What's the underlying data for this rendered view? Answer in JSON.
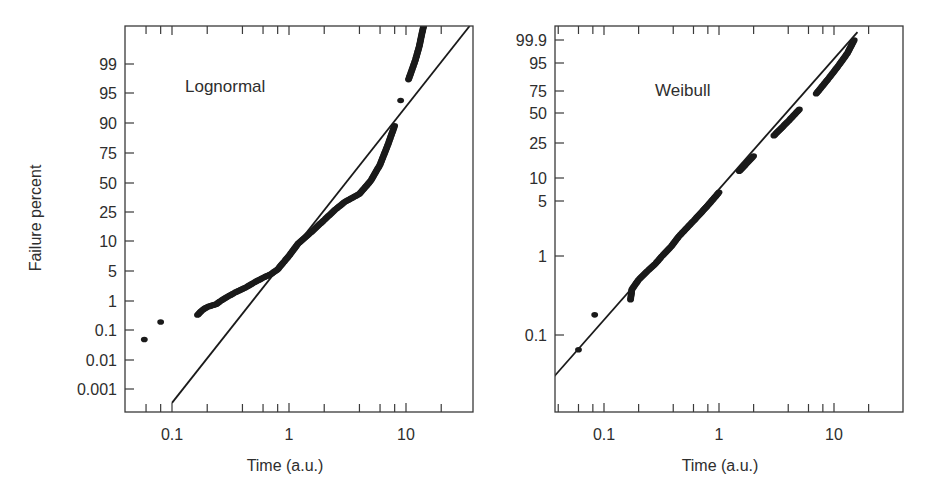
{
  "figure": {
    "ylabel": "Failure percent",
    "colors": {
      "ink": "#1a1a1a",
      "text": "#2e2e2e",
      "frame": "#3a3a3a",
      "background": "#ffffff"
    }
  },
  "chart_data": [
    {
      "type": "scatter",
      "title": "Lognormal",
      "panel_label": "Lognormal",
      "xlabel": "Time (a.u.)",
      "ylabel": "Failure percent",
      "xscale": "log",
      "yscale": "lognormal probability",
      "xlim": [
        0.04,
        40
      ],
      "x_ticks": [
        0.1,
        1,
        10
      ],
      "x_tick_labels": [
        "0.1",
        "1",
        "10"
      ],
      "y_ticks": [
        0.001,
        0.01,
        0.1,
        1,
        5,
        10,
        25,
        50,
        75,
        90,
        95,
        99
      ],
      "y_tick_labels": [
        "0.001",
        "0.01",
        "0.1",
        "1",
        "5",
        "10",
        "25",
        "50",
        "75",
        "90",
        "95",
        "99"
      ],
      "grid": false,
      "fit_line": {
        "from": [
          0.1,
          0.0003
        ],
        "to": [
          35,
          99.99
        ]
      },
      "series": [
        {
          "name": "data",
          "points": [
            [
              0.058,
              0.05
            ],
            [
              0.08,
              0.2
            ],
            [
              0.165,
              0.35
            ],
            [
              0.18,
              0.5
            ],
            [
              0.2,
              0.65
            ],
            [
              0.24,
              0.8
            ],
            [
              0.26,
              1.0
            ],
            [
              0.3,
              1.3
            ],
            [
              0.34,
              1.6
            ],
            [
              0.43,
              2.2
            ],
            [
              0.5,
              2.8
            ],
            [
              0.6,
              3.6
            ],
            [
              0.7,
              4.3
            ],
            [
              0.8,
              5.2
            ],
            [
              0.9,
              6.2
            ],
            [
              1.0,
              7.2
            ],
            [
              1.2,
              9.5
            ],
            [
              1.5,
              13
            ],
            [
              2.0,
              20
            ],
            [
              2.5,
              27
            ],
            [
              3.0,
              33
            ],
            [
              4.0,
              40
            ],
            [
              5.0,
              52
            ],
            [
              6.0,
              66
            ],
            [
              7.0,
              80
            ],
            [
              8.0,
              89
            ],
            [
              9.0,
              94
            ],
            [
              10.5,
              97.5
            ],
            [
              12.0,
              99.2
            ],
            [
              13.0,
              99.7
            ],
            [
              13.5,
              99.85
            ],
            [
              14.5,
              99.96
            ]
          ]
        }
      ]
    },
    {
      "type": "scatter",
      "title": "Weibull",
      "panel_label": "Weibull",
      "xlabel": "Time (a.u.)",
      "ylabel": "",
      "xscale": "log",
      "yscale": "weibull probability",
      "xlim": [
        0.037,
        40
      ],
      "x_ticks": [
        0.1,
        1,
        10
      ],
      "x_tick_labels": [
        "0.1",
        "1",
        "10"
      ],
      "y_ticks": [
        0.1,
        1,
        5,
        10,
        25,
        50,
        75,
        95,
        99.9
      ],
      "y_tick_labels": [
        "0.1",
        "1",
        "5",
        "10",
        "25",
        "50",
        "75",
        "95",
        "99.9"
      ],
      "grid": false,
      "fit_line": {
        "from": [
          0.037,
          0.03
        ],
        "to": [
          16,
          99.99
        ]
      },
      "series": [
        {
          "name": "data",
          "points": [
            [
              0.06,
              0.065
            ],
            [
              0.083,
              0.18
            ],
            [
              0.17,
              0.28
            ],
            [
              0.175,
              0.38
            ],
            [
              0.2,
              0.5
            ],
            [
              0.24,
              0.65
            ],
            [
              0.28,
              0.8
            ],
            [
              0.32,
              1.0
            ],
            [
              0.38,
              1.3
            ],
            [
              0.45,
              1.8
            ],
            [
              0.6,
              2.8
            ],
            [
              0.8,
              4.4
            ],
            [
              1.0,
              6.5
            ],
            [
              1.5,
              12
            ],
            [
              2.0,
              18
            ],
            [
              3.0,
              30
            ],
            [
              4.0,
              42
            ],
            [
              5.0,
              54
            ],
            [
              7.0,
              72
            ],
            [
              9.0,
              86
            ],
            [
              11.0,
              94
            ],
            [
              13.0,
              98.5
            ],
            [
              15.0,
              99.9
            ]
          ]
        }
      ]
    }
  ]
}
